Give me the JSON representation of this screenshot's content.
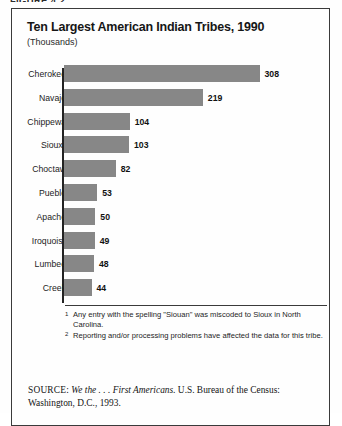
{
  "figure": {
    "caption": "FIGURE 4.2"
  },
  "chart": {
    "title": "Ten Largest American Indian Tribes, 1990",
    "subtitle": "(Thousands)"
  },
  "chart_data": {
    "type": "bar",
    "orientation": "horizontal",
    "title": "Ten Largest American Indian Tribes, 1990",
    "subtitle": "(Thousands)",
    "xlabel": "",
    "ylabel": "",
    "units": "Thousands",
    "grid": false,
    "legend": null,
    "xlim": [
      0,
      308
    ],
    "categories": [
      "Cherokee",
      "Navajo",
      "Chippewa",
      "Sioux",
      "Choctaw",
      "Pueblo",
      "Apache",
      "Iroquois",
      "Lumbee",
      "Creek"
    ],
    "values": [
      308,
      219,
      104,
      103,
      82,
      53,
      50,
      49,
      48,
      44
    ],
    "category_footnote_markers": [
      "",
      "",
      "",
      "1",
      "",
      "",
      "",
      "2",
      "",
      ""
    ],
    "bar_color": "#878787",
    "axis_color": "#232323"
  },
  "footnotes": [
    {
      "marker": "1",
      "text": "Any entry with the spelling \"Siouan\" was miscoded to Sioux in North Carolina."
    },
    {
      "marker": "2",
      "text": "Reporting and/or processing problems have affected the data for this tribe."
    }
  ],
  "source": {
    "label": "SOURCE:",
    "title": "We the . . . First Americans.",
    "rest": " U.S. Bureau of the Census: Washington, D.C., 1993."
  }
}
